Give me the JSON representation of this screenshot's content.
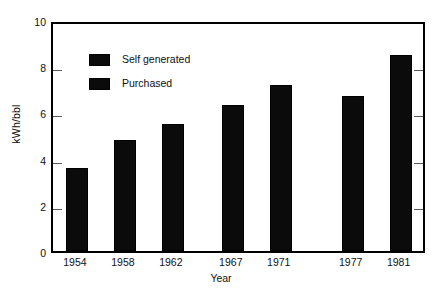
{
  "chart_data": {
    "type": "bar",
    "title": "",
    "subtitle": "",
    "xlabel": "Year",
    "ylabel": "kWh/bbl",
    "categories": [
      "1954",
      "1958",
      "1962",
      "1967",
      "1971",
      "1977",
      "1981"
    ],
    "values": [
      3.6,
      4.8,
      5.5,
      6.3,
      7.2,
      6.7,
      8.5
    ],
    "series": [
      {
        "name": "Self generated",
        "values": [
          3.6,
          4.8,
          5.5,
          6.3,
          7.2,
          6.7,
          8.5
        ]
      }
    ],
    "ylim": [
      0,
      10
    ],
    "yticks": [
      0,
      2,
      4,
      6,
      8,
      10
    ],
    "ytick_labels": [
      "0",
      "2",
      "4",
      "6",
      "8",
      "10"
    ],
    "grid": false,
    "legend_position": "upper-left-inside",
    "legend": [
      "Self generated",
      "Purchased"
    ],
    "bar_color": "#0b0b0b",
    "frame_color": "#000000",
    "background_color": "#ffffff",
    "annotations": []
  },
  "axes": {
    "y": {
      "title": "kWh/bbl",
      "ticks": [
        {
          "label": "10",
          "value": 10
        },
        {
          "label": "8",
          "value": 8
        },
        {
          "label": "6",
          "value": 6
        },
        {
          "label": "4",
          "value": 4
        },
        {
          "label": "2",
          "value": 2
        },
        {
          "label": "0",
          "value": 0
        }
      ]
    },
    "x": {
      "title": "Year",
      "ticks": [
        {
          "label": "1954",
          "value": 1954
        },
        {
          "label": "1958",
          "value": 1958
        },
        {
          "label": "1962",
          "value": 1962
        },
        {
          "label": "1967",
          "value": 1967
        },
        {
          "label": "1971",
          "value": 1971
        },
        {
          "label": "1977",
          "value": 1977
        },
        {
          "label": "1981",
          "value": 1981
        }
      ]
    }
  },
  "legend": {
    "items": [
      {
        "label": "Self generated",
        "color": "#0b0b0b"
      },
      {
        "label": "Purchased",
        "color": "#0b0b0b"
      }
    ]
  }
}
